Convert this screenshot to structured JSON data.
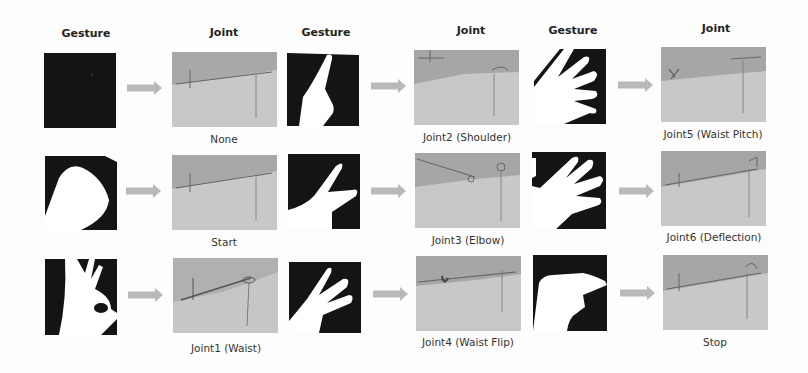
{
  "headers": [
    {
      "label": "Gesture"
    },
    {
      "label": "Joint"
    },
    {
      "label": "Gesture"
    },
    {
      "label": "Joint"
    },
    {
      "label": "Gesture"
    },
    {
      "label": "Joint"
    }
  ],
  "columns": [
    {
      "rows": [
        {
          "gesture": "empty-dark-frame",
          "joint_label": "None"
        },
        {
          "gesture": "fist",
          "joint_label": "Start"
        },
        {
          "gesture": "ok-sign",
          "joint_label": "Joint1 (Waist)"
        }
      ]
    },
    {
      "rows": [
        {
          "gesture": "one-finger",
          "joint_label": "Joint2 (Shoulder)"
        },
        {
          "gesture": "two-fingers",
          "joint_label": "Joint3 (Elbow)"
        },
        {
          "gesture": "three-fingers",
          "joint_label": "Joint4 (Waist Flip)"
        }
      ]
    },
    {
      "rows": [
        {
          "gesture": "four-fingers",
          "joint_label": "Joint5 (Waist Pitch)"
        },
        {
          "gesture": "five-fingers",
          "joint_label": "Joint6 (Deflection)"
        },
        {
          "gesture": "flat-hand",
          "joint_label": "Stop"
        }
      ]
    }
  ],
  "colors": {
    "arrow": "#b9b9b9",
    "gesture_bg": "#111111",
    "hand": "#ffffff",
    "scene_top": "#a9a9a9",
    "scene_bottom": "#c9c9c9"
  }
}
